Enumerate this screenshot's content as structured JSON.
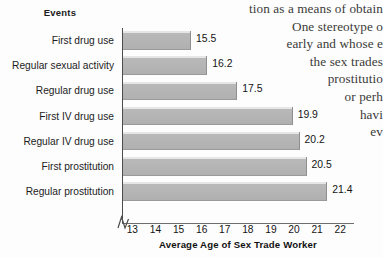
{
  "chart_data": {
    "type": "bar",
    "orientation": "horizontal",
    "title": "",
    "category_axis_title": "Events",
    "xlabel": "Average Age of Sex Trade Worker",
    "ylabel": "",
    "xlim": [
      12.55,
      22.6
    ],
    "xticks": [
      13,
      14,
      15,
      16,
      17,
      18,
      19,
      20,
      21,
      22
    ],
    "axis_break": true,
    "grid": false,
    "legend": false,
    "categories": [
      "First drug use",
      "Regular sexual activity",
      "Regular drug use",
      "First IV drug use",
      "Regular IV drug use",
      "First prostitution",
      "Regular prostitution"
    ],
    "values": [
      15.5,
      16.2,
      17.5,
      19.9,
      20.2,
      20.5,
      21.4
    ],
    "value_labels": [
      "15.5",
      "16.2",
      "17.5",
      "19.9",
      "20.2",
      "20.5",
      "21.4"
    ],
    "bar_color": "#b3b3b3",
    "bar_highlight_color": "#e6e6e6",
    "axis_color": "#4c4c4c",
    "text_color": "#141414"
  },
  "background_text": {
    "lines": [
      "tion as a means of obtain",
      "One stereotype o",
      "early and whose e",
      "the sex trades",
      "prostitutio",
      "or perh",
      "havi",
      "ev"
    ]
  }
}
